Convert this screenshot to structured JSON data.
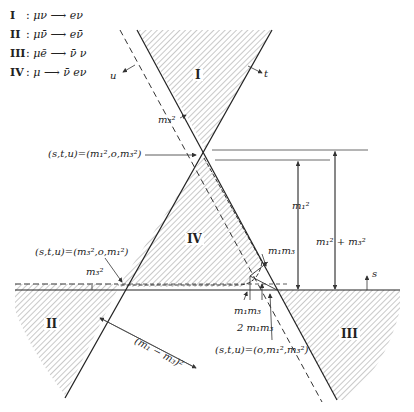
{
  "legend": [
    {
      "id": "I",
      "label": "I",
      "sep": ":",
      "initial": "μν",
      "final": "eν"
    },
    {
      "id": "II",
      "label": "II",
      "sep": ":",
      "initial": "μν̄",
      "final": "eν̄"
    },
    {
      "id": "III",
      "label": "III",
      "sep": ":",
      "initial": "μē",
      "final": "ν̄  ν"
    },
    {
      "id": "IV",
      "label": "IV",
      "sep": ":",
      "initial": "μ",
      "final": "ν̄  eν"
    }
  ],
  "arrow": "⟶",
  "regions": {
    "I": "I",
    "II": "II",
    "III": "III",
    "IV": "IV"
  },
  "axis_labels": {
    "u": "u",
    "t": "t",
    "s": "s"
  },
  "annotations": {
    "m3sq_top": "m₃²",
    "m3sq_left": "m₃²",
    "point_top": "(s,t,u)=(m₁²,o,m₃²)",
    "point_left": "(s,t,u)=(m₃²,o,m₁²)",
    "point_bottom": "(s,t,u)=(o,m₁²,m₃²)",
    "m1sq": "m₁²",
    "m1sq_plus_m3sq": "m₁² + m₃²",
    "m1m3_right": "m₁m₃",
    "m1m3_bottom": "m₁m₃",
    "two_m1m3": "2 m₁m₃",
    "diff_sq": "(m₁ − m₃)²"
  }
}
